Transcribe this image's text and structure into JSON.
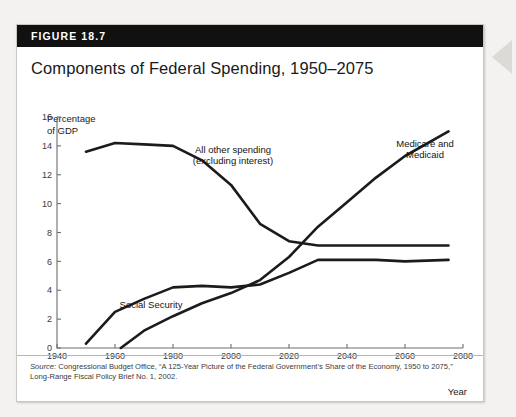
{
  "figure": {
    "label": "FIGURE 18.7",
    "title": "Components of Federal Spending, 1950–2075"
  },
  "source": {
    "prefix": "Source:",
    "text": " Congressional Budget Office, “A 125-Year Picture of the Federal Government’s Share of the Economy, 1950 to 2075,” Long-Range Fiscal Policy Brief No. 1, 2002."
  },
  "chart_data": {
    "type": "line",
    "title": "Components of Federal Spending, 1950–2075",
    "xlabel": "Year",
    "ylabel": "Percentage of GDP",
    "ylabel_line1": "Percentage",
    "ylabel_line2": "of GDP",
    "xlim": [
      1940,
      2080
    ],
    "ylim": [
      0,
      16
    ],
    "xticks": [
      1940,
      1960,
      1980,
      2000,
      2020,
      2040,
      2060,
      2080
    ],
    "yticks": [
      0,
      2,
      4,
      6,
      8,
      10,
      12,
      14,
      16
    ],
    "grid": false,
    "legend": "inline-annotations",
    "series": [
      {
        "name": "All other spending (excluding interest)",
        "label_line1": "All other spending",
        "label_line2": "(excluding interest)",
        "color": "#1b1b1b",
        "x": [
          1950,
          1960,
          1970,
          1980,
          1990,
          2000,
          2010,
          2020,
          2030,
          2050,
          2075
        ],
        "values": [
          13.6,
          14.2,
          14.1,
          14.0,
          13.0,
          11.3,
          8.6,
          7.4,
          7.1,
          7.1,
          7.1
        ]
      },
      {
        "name": "Social Security",
        "label_line1": "Social Security",
        "color": "#1b1b1b",
        "x": [
          1950,
          1960,
          1970,
          1980,
          1990,
          2000,
          2010,
          2020,
          2030,
          2050,
          2060,
          2075
        ],
        "values": [
          0.3,
          2.5,
          3.4,
          4.2,
          4.3,
          4.2,
          4.4,
          5.2,
          6.1,
          6.1,
          6.0,
          6.1
        ]
      },
      {
        "name": "Medicare and Medicaid",
        "label_line1": "Medicare and",
        "label_line2": "Medicaid",
        "color": "#1b1b1b",
        "x": [
          1962,
          1970,
          1980,
          1990,
          2000,
          2010,
          2020,
          2030,
          2040,
          2050,
          2060,
          2075
        ],
        "values": [
          0.0,
          1.2,
          2.2,
          3.1,
          3.8,
          4.7,
          6.3,
          8.4,
          10.1,
          11.8,
          13.3,
          15.0
        ]
      }
    ],
    "annotations": [
      {
        "name": "all-other-spending",
        "text": "All other spending (excluding interest)"
      },
      {
        "name": "social-security",
        "text": "Social Security"
      },
      {
        "name": "medicare-medicaid",
        "text": "Medicare and Medicaid"
      }
    ]
  },
  "bleed": {
    "line1": "",
    "line2": "",
    "line3": ""
  }
}
